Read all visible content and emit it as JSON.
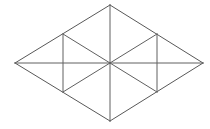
{
  "figure": {
    "shape_name": "rhombus",
    "background_color": "#ffffff",
    "stroke_color": "#5a5a5a",
    "fill_color": "#ffffff",
    "stroke_width": 1,
    "canvas": {
      "width": 210,
      "height": 129
    },
    "vertices": {
      "left": {
        "label": "left",
        "x": 15,
        "y": 63
      },
      "top": {
        "label": "top",
        "x": 110,
        "y": 5
      },
      "right": {
        "label": "right",
        "x": 203,
        "y": 63
      },
      "bottom": {
        "label": "bottom",
        "x": 110,
        "y": 121
      },
      "center": {
        "label": "center",
        "x": 110,
        "y": 63
      },
      "upper_left_mid": {
        "label": "upper-left-mid",
        "x": 63,
        "y": 34
      },
      "lower_left_mid": {
        "label": "lower-left-mid",
        "x": 63,
        "y": 92
      },
      "upper_right_mid": {
        "label": "upper-right-mid",
        "x": 157,
        "y": 34
      },
      "lower_right_mid": {
        "label": "lower-right-mid",
        "x": 157,
        "y": 92
      }
    },
    "outline_path": "M 15 63 L 110 5 L 203 63 L 110 121 Z",
    "faces": [
      {
        "name": "face-upper-left",
        "points": "15,63 110,5 63,34"
      },
      {
        "name": "face-upper-mid-left",
        "points": "63,34 110,5 110,63"
      },
      {
        "name": "face-upper-mid-right",
        "points": "110,5 157,34 110,63"
      },
      {
        "name": "face-upper-right",
        "points": "157,34 203,63 110,63"
      },
      {
        "name": "face-lower-left",
        "points": "15,63 63,92 110,63"
      },
      {
        "name": "face-lower-mid-left",
        "points": "63,92 110,121 110,63"
      },
      {
        "name": "face-lower-mid-right",
        "points": "110,121 157,92 110,63"
      },
      {
        "name": "face-lower-right",
        "points": "157,92 203,63 110,63"
      }
    ],
    "edges": {
      "outer": [
        {
          "name": "edge-left-top",
          "x1": 15,
          "y1": 63,
          "x2": 110,
          "y2": 5
        },
        {
          "name": "edge-top-right",
          "x1": 110,
          "y1": 5,
          "x2": 203,
          "y2": 63
        },
        {
          "name": "edge-right-bottom",
          "x1": 203,
          "y1": 63,
          "x2": 110,
          "y2": 121
        },
        {
          "name": "edge-bottom-left",
          "x1": 110,
          "y1": 121,
          "x2": 15,
          "y2": 63
        }
      ],
      "inner": [
        {
          "name": "edge-horizontal-diagonal",
          "x1": 15,
          "y1": 63,
          "x2": 203,
          "y2": 63
        },
        {
          "name": "edge-vertical-diagonal",
          "x1": 110,
          "y1": 5,
          "x2": 110,
          "y2": 121
        },
        {
          "name": "edge-upper-left-chord",
          "x1": 63,
          "y1": 34,
          "x2": 110,
          "y2": 63
        },
        {
          "name": "edge-upper-right-chord",
          "x1": 157,
          "y1": 34,
          "x2": 110,
          "y2": 63
        },
        {
          "name": "edge-lower-left-chord",
          "x1": 63,
          "y1": 92,
          "x2": 110,
          "y2": 63
        },
        {
          "name": "edge-lower-right-chord",
          "x1": 157,
          "y1": 92,
          "x2": 110,
          "y2": 63
        },
        {
          "name": "edge-left-vertical",
          "x1": 63,
          "y1": 34,
          "x2": 63,
          "y2": 92
        },
        {
          "name": "edge-right-vertical",
          "x1": 157,
          "y1": 34,
          "x2": 157,
          "y2": 92
        }
      ]
    },
    "counts": {
      "triangle_count": 6,
      "vertex_count": 9,
      "edge_count": 12
    }
  }
}
